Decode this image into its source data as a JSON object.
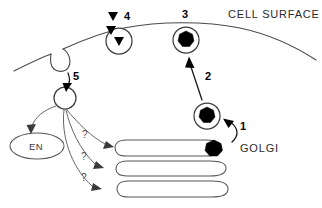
{
  "figure": {
    "background_color": "#ffffff",
    "line_color": "#3a3a3a",
    "cargo_color": "#000000",
    "width": 322,
    "height": 208
  },
  "labels": {
    "cell_surface": "CELL SURFACE",
    "golgi": "GOLGI",
    "endosome": "EN",
    "step_1": "1",
    "step_2": "2",
    "step_3": "3",
    "step_4": "4",
    "step_5": "5",
    "unknown_1": "?",
    "unknown_2": "?",
    "unknown_3": "?"
  },
  "structures": {
    "cell_membrane": "plasma-membrane-curve",
    "membrane_invagination": "coated-pit",
    "golgi_cisternae_count": 3,
    "vesicles": [
      {
        "name": "golgi-budding-vesicle",
        "cargo": "dark-hexagon-core",
        "step": "1"
      },
      {
        "name": "transport-vesicle",
        "cargo": "dark-hexagon-core",
        "step": "2"
      },
      {
        "name": "surface-fused-vesicle",
        "cargo": "dark-hexagon-core",
        "step": "3"
      },
      {
        "name": "secreting-vesicle",
        "cargo": "triangle-cargo",
        "step": "4"
      },
      {
        "name": "endocytic-vesicle",
        "cargo": "empty",
        "step": "5"
      }
    ],
    "cargo_triangles": 3
  }
}
